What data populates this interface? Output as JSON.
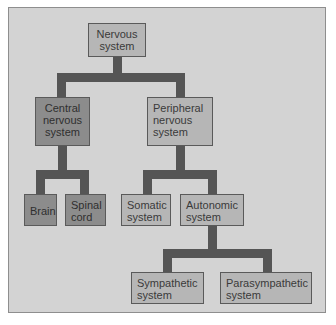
{
  "diagram": {
    "colors": {
      "background": "#d3d3d3",
      "frame_border": "#8e8e8e",
      "connector": "#555555",
      "node_light": "#b6b6b6",
      "node_dark": "#8c8c8c"
    },
    "nodes": {
      "root": {
        "label": "Nervous\nsystem"
      },
      "central": {
        "label": "Central\nnervous\nsystem"
      },
      "peripheral": {
        "label": "Peripheral\nnervous\nsystem"
      },
      "brain": {
        "label": "Brain"
      },
      "spinal": {
        "label": "Spinal\ncord"
      },
      "somatic": {
        "label": "Somatic\nsystem"
      },
      "autonomic": {
        "label": "Autonomic\nsystem"
      },
      "sympathetic": {
        "label": "Sympathetic\nsystem"
      },
      "parasympathetic": {
        "label": "Parasympathetic\nsystem"
      }
    },
    "edges": [
      [
        "Nervous system",
        "Central nervous system"
      ],
      [
        "Nervous system",
        "Peripheral nervous system"
      ],
      [
        "Central nervous system",
        "Brain"
      ],
      [
        "Central nervous system",
        "Spinal cord"
      ],
      [
        "Peripheral nervous system",
        "Somatic system"
      ],
      [
        "Peripheral nervous system",
        "Autonomic system"
      ],
      [
        "Autonomic system",
        "Sympathetic system"
      ],
      [
        "Autonomic system",
        "Parasympathetic system"
      ]
    ]
  }
}
